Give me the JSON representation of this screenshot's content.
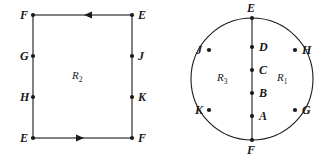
{
  "figure": {
    "background_color": "#ffffff",
    "stroke_color": "#1a1a1a",
    "text_color": "#1a1a1a"
  },
  "rectangle_figure": {
    "name": "rectangle-identification-diagram",
    "region": {
      "label": "R",
      "subscript": "2",
      "full": "R2"
    },
    "corners": [
      {
        "id": "top-left",
        "label": "F"
      },
      {
        "id": "top-right",
        "label": "E"
      },
      {
        "id": "bottom-left",
        "label": "E"
      },
      {
        "id": "bottom-right",
        "label": "F"
      }
    ],
    "edge_points": [
      {
        "id": "left-upper",
        "label": "G"
      },
      {
        "id": "left-lower",
        "label": "H"
      },
      {
        "id": "right-upper",
        "label": "J"
      },
      {
        "id": "right-lower",
        "label": "K"
      }
    ],
    "arrows": [
      {
        "id": "top-edge-arrow",
        "direction": "left"
      },
      {
        "id": "bottom-edge-arrow",
        "direction": "right"
      }
    ]
  },
  "circle_figure": {
    "name": "circle-diameter-diagram",
    "regions": [
      {
        "id": "left-region",
        "label": "R",
        "subscript": "3",
        "full": "R3"
      },
      {
        "id": "right-region",
        "label": "R",
        "subscript": "1",
        "full": "R1"
      }
    ],
    "pole_points": [
      {
        "id": "top-pole",
        "label": "E"
      },
      {
        "id": "bottom-pole",
        "label": "F"
      }
    ],
    "diameter_points": [
      {
        "id": "diameter-1",
        "label": "D"
      },
      {
        "id": "diameter-2",
        "label": "C"
      },
      {
        "id": "diameter-3",
        "label": "B"
      },
      {
        "id": "diameter-4",
        "label": "A"
      }
    ],
    "circumference_points": [
      {
        "id": "upper-left",
        "label": "J"
      },
      {
        "id": "upper-right",
        "label": "H"
      },
      {
        "id": "lower-left",
        "label": "K"
      },
      {
        "id": "lower-right",
        "label": "G"
      }
    ]
  }
}
